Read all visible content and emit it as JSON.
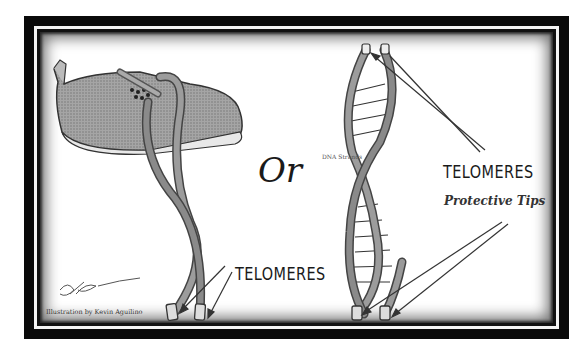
{
  "figure": {
    "left_panel": {
      "subject": "shoe-with-laces",
      "label": "TELOMERES",
      "signature": "KA"
    },
    "center": {
      "connector_word": "Or"
    },
    "right_panel": {
      "subject": "dna-double-helix",
      "strand_label": "DNA Strands",
      "label": "TELOMERES",
      "sublabel": "Protective Tips"
    },
    "credit": "Illustration by Kevin Aguilino"
  },
  "colors": {
    "frame": "#0a0a0a",
    "background": "#ffffff",
    "ink": "#1a1a1a",
    "lace_fill": "#8a8a8a",
    "shoe_fill": "#9a9a9a"
  }
}
